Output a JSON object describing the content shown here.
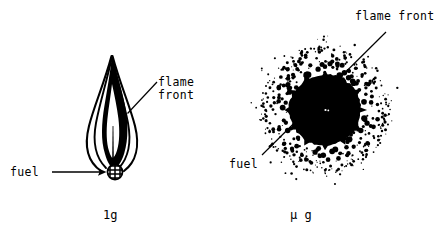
{
  "figure": {
    "background_color": "#ffffff",
    "ink_color": "#000000",
    "width": 444,
    "height": 235
  },
  "panels": [
    {
      "id": "normal-gravity",
      "caption": "1g",
      "description": "Elongated teardrop flame above a fuel droplet",
      "labels": {
        "flame_front_line1": "flame",
        "flame_front_line2": "front",
        "fuel": "fuel"
      },
      "leader_lines": [
        {
          "name": "flame-front-leader",
          "x1": 156,
          "y1": 82,
          "x2": 127,
          "y2": 114
        },
        {
          "name": "fuel-arrow",
          "x1": 52,
          "y1": 172,
          "x2": 104,
          "y2": 172,
          "arrowhead": true
        }
      ],
      "flame": {
        "tip_x": 112,
        "tip_y": 55,
        "base_x": 114,
        "base_y": 168,
        "max_half_width": 22
      },
      "fuel_droplet": {
        "cx": 115,
        "cy": 172,
        "r": 8,
        "pattern": "cross-hatch"
      }
    },
    {
      "id": "microgravity",
      "caption": "µ g",
      "description": "Spherical flame: solid dark core surrounded by a halo of scattered soot dots",
      "labels": {
        "flame_front": "flame front",
        "fuel": "fuel"
      },
      "leader_lines": [
        {
          "name": "flame-front-fuel-leader",
          "x1": 263,
          "y1": 154,
          "x2": 386,
          "y2": 33
        }
      ],
      "sphere": {
        "cx": 325,
        "cy": 110,
        "core_r": 36,
        "cloud_r": 64,
        "dot_count": 420
      }
    }
  ]
}
